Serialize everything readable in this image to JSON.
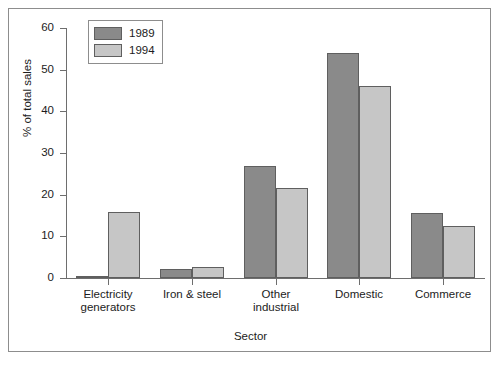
{
  "chart_data": {
    "type": "bar",
    "title": "",
    "xlabel": "Sector",
    "ylabel": "% of total sales",
    "categories": [
      "Electricity generators",
      "Iron & steel",
      "Other industrial",
      "Domestic",
      "Commerce"
    ],
    "category_lines": [
      [
        "Electricity",
        "generators"
      ],
      [
        "Iron & steel",
        ""
      ],
      [
        "Other",
        "industrial"
      ],
      [
        "Domestic",
        ""
      ],
      [
        "Commerce",
        ""
      ]
    ],
    "series": [
      {
        "name": "1989",
        "color": "#8a8a8a",
        "values": [
          0.5,
          2.2,
          27.0,
          54.0,
          15.5
        ]
      },
      {
        "name": "1994",
        "color": "#c6c6c6",
        "values": [
          15.8,
          2.6,
          21.5,
          46.2,
          12.6
        ]
      }
    ],
    "ylim": [
      0,
      60
    ],
    "yticks": [
      0,
      10,
      20,
      30,
      40,
      50,
      60
    ],
    "ytick_labels": [
      "0",
      "10",
      "20",
      "30",
      "40",
      "50",
      "60"
    ],
    "grid": false,
    "legend_position": "top-left"
  },
  "legend": {
    "entries": [
      {
        "label": "1989"
      },
      {
        "label": "1994"
      }
    ]
  },
  "colors": {
    "series_1989": "#8a8a8a",
    "series_1994": "#c6c6c6",
    "axis": "#6e6e6e",
    "frame": "#8d8d8d",
    "text": "#1c1c1c",
    "background": "#ffffff"
  }
}
